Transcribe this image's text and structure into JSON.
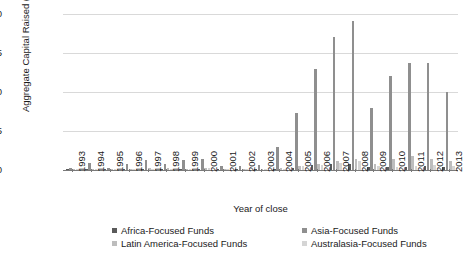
{
  "chart_data": {
    "type": "bar",
    "title": "",
    "xlabel": "Year of close",
    "ylabel": "Aggregate Capital Raised ($bn)",
    "ylim": [
      0,
      90
    ],
    "yticks": [
      0.0,
      22.5,
      45.0,
      67.5,
      90.0
    ],
    "ytick_labels": [
      "0.0",
      "22.5",
      "45.0",
      "67.5",
      "90.0"
    ],
    "grid": true,
    "legend_position": "bottom",
    "categories": [
      "1993",
      "1994",
      "1995",
      "1996",
      "1997",
      "1998",
      "1999",
      "2000",
      "2001",
      "2002",
      "2003",
      "2004",
      "2005",
      "2006",
      "2007",
      "2008",
      "2009",
      "2010",
      "2011",
      "2012",
      "2013"
    ],
    "series": [
      {
        "name": "Africa-Focused Funds",
        "color": "#5a5a5a",
        "values": [
          0.2,
          0.2,
          0.1,
          0.3,
          0.4,
          0.5,
          0.5,
          0.6,
          0.3,
          0.3,
          0.4,
          0.6,
          1.2,
          2.8,
          3.2,
          3.6,
          1.6,
          1.6,
          2.0,
          2.4,
          2.0
        ]
      },
      {
        "name": "Asia-Focused Funds",
        "color": "#8f8f8f",
        "values": [
          1.2,
          3.8,
          1.0,
          3.6,
          6.0,
          3.4,
          5.6,
          6.4,
          2.6,
          2.4,
          3.0,
          13.0,
          33.0,
          58.0,
          77.0,
          86.0,
          36.0,
          54.0,
          62.0,
          62.0,
          45.0
        ]
      },
      {
        "name": "Latin America-Focused Funds",
        "color": "#bdbdbd",
        "values": [
          0.3,
          0.4,
          0.2,
          0.5,
          1.4,
          1.0,
          0.8,
          1.2,
          0.4,
          0.3,
          0.4,
          1.0,
          2.6,
          3.4,
          5.4,
          6.4,
          3.4,
          6.6,
          8.2,
          6.6,
          5.0
        ]
      },
      {
        "name": "Australasia-Focused Funds",
        "color": "#d5d5d5",
        "values": [
          0.2,
          0.2,
          0.1,
          0.3,
          0.6,
          0.6,
          0.6,
          0.9,
          0.4,
          0.3,
          0.4,
          0.8,
          2.2,
          3.0,
          4.2,
          5.0,
          2.2,
          2.0,
          2.6,
          3.0,
          2.6
        ]
      }
    ]
  },
  "legend": {
    "items": [
      "Africa-Focused Funds",
      "Asia-Focused Funds",
      "Latin America-Focused Funds",
      "Australasia-Focused Funds"
    ]
  }
}
